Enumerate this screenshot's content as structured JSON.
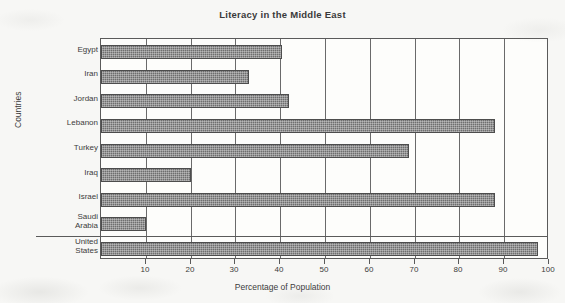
{
  "chart_data": {
    "type": "bar",
    "orientation": "horizontal",
    "title": "Literacy in the Middle East",
    "xlabel": "Percentage of Population",
    "ylabel": "Countries",
    "categories": [
      "Egypt",
      "Iran",
      "Jordan",
      "Lebanon",
      "Turkey",
      "Iraq",
      "Israel",
      "Saudi Arabia",
      "United States"
    ],
    "values": [
      40.3,
      33,
      42,
      88,
      68.7,
      20,
      88,
      10,
      97.6
    ],
    "value_labels": [
      "40.3",
      "33",
      "42",
      "88",
      "68.7",
      "20",
      "88",
      "10",
      "97.6"
    ],
    "xlim": [
      0,
      100
    ],
    "xticks": [
      10,
      20,
      30,
      40,
      50,
      60,
      70,
      80,
      90,
      100
    ],
    "xtick_labels": [
      "10",
      "20",
      "30",
      "40",
      "50",
      "60",
      "70",
      "80",
      "90",
      "100"
    ],
    "grid": true,
    "legend": null,
    "bar_color": "#6e6e6e",
    "frame_color": "#5a5a5a",
    "background": "#f7f7f5"
  },
  "category_display": [
    {
      "lines": [
        "Egypt"
      ]
    },
    {
      "lines": [
        "Iran"
      ]
    },
    {
      "lines": [
        "Jordan"
      ]
    },
    {
      "lines": [
        "Lebanon"
      ]
    },
    {
      "lines": [
        "Turkey"
      ]
    },
    {
      "lines": [
        "Iraq"
      ]
    },
    {
      "lines": [
        "Israel"
      ]
    },
    {
      "lines": [
        "Saudi",
        "Arabia"
      ]
    },
    {
      "lines": [
        "United",
        "States"
      ]
    }
  ]
}
